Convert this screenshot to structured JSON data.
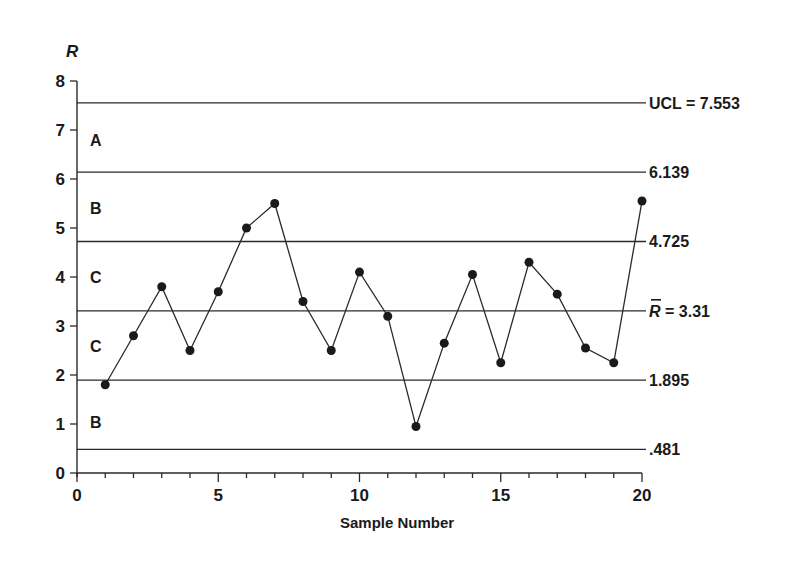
{
  "chart_data": {
    "type": "line",
    "title": "",
    "xlabel": "Sample Number",
    "ylabel": "R",
    "xlim": [
      0,
      20
    ],
    "ylim": [
      0,
      8
    ],
    "x_ticks": [
      0,
      5,
      10,
      15,
      20
    ],
    "x_tick_labels": [
      "0",
      "5",
      "10",
      "15",
      "20"
    ],
    "y_ticks": [
      0,
      1,
      2,
      3,
      4,
      5,
      6,
      7,
      8
    ],
    "y_tick_labels": [
      "0",
      "1",
      "2",
      "3",
      "4",
      "5",
      "6",
      "7",
      "8"
    ],
    "grid": false,
    "series": [
      {
        "name": "R",
        "x": [
          1,
          2,
          3,
          4,
          5,
          6,
          7,
          8,
          9,
          10,
          11,
          12,
          13,
          14,
          15,
          16,
          17,
          18,
          19,
          20
        ],
        "values": [
          1.8,
          2.8,
          3.8,
          2.5,
          3.7,
          5.0,
          5.5,
          3.5,
          2.5,
          4.1,
          3.2,
          0.95,
          2.65,
          4.05,
          2.25,
          4.3,
          3.65,
          2.55,
          2.25,
          5.55
        ]
      }
    ],
    "reference_lines": [
      {
        "value": 7.553,
        "label": "UCL = 7.553"
      },
      {
        "value": 6.139,
        "label": "6.139"
      },
      {
        "value": 4.725,
        "label": "4.725"
      },
      {
        "value": 3.31,
        "label": "R̅ = 3.31",
        "label_var": "R",
        "label_rest": "= 3.31"
      },
      {
        "value": 1.895,
        "label": "1.895"
      },
      {
        "value": 0.481,
        "label": ".481"
      }
    ],
    "zones": [
      {
        "label": "A",
        "y": 6.8
      },
      {
        "label": "B",
        "y": 5.4
      },
      {
        "label": "C",
        "y": 4.0
      },
      {
        "label": "C",
        "y": 2.6
      },
      {
        "label": "B",
        "y": 1.05
      }
    ]
  }
}
